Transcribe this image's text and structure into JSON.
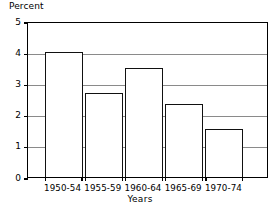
{
  "chart_data": {
    "type": "bar",
    "title": "",
    "categories": [
      "1950-54",
      "1955-59",
      "1960-64",
      "1965-69",
      "1970-74"
    ],
    "values": [
      4.0,
      2.7,
      3.5,
      2.35,
      1.55
    ],
    "xlabel": "Years",
    "ylabel": "Percent",
    "ylim": [
      0,
      5
    ],
    "yticks": [
      0,
      1,
      2,
      3,
      4,
      5
    ],
    "ytick_labels": [
      "0",
      "1",
      "2",
      "3",
      "4",
      "5"
    ],
    "grid": "horizontal",
    "legend": "none",
    "bar_fill_color": "#ffffff",
    "bar_edge_color": "#111111",
    "gridline_color": "#8a8a8a",
    "axis_color": "#000000"
  },
  "axes": {
    "y_title": "Percent",
    "x_title": "Years"
  }
}
